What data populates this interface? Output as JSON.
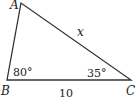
{
  "diagram": {
    "type": "triangle",
    "vertices": {
      "A": {
        "label": "A"
      },
      "B": {
        "label": "B"
      },
      "C": {
        "label": "C"
      }
    },
    "side_labels": {
      "AC": "x",
      "BC": "10"
    },
    "angle_labels": {
      "B": "80°",
      "C": "35°"
    },
    "stroke_color": "#333333"
  }
}
